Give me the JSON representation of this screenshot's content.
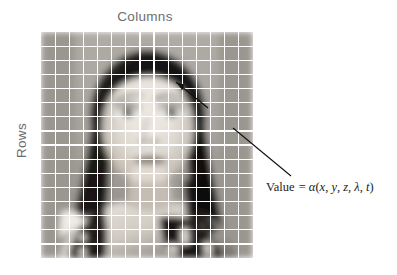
{
  "figure": {
    "background_color": "#ffffff",
    "width": 397,
    "height": 275
  },
  "axes": {
    "columns_label": "Columns",
    "rows_label": "Rows",
    "label_color": "#6e6e6e"
  },
  "image_grid": {
    "description": "grayscale portrait photograph overlaid with a white sampling grid",
    "columns": 15,
    "rows": 16,
    "grid_line_color": "#ffffff",
    "left": 41,
    "top": 32,
    "width": 212,
    "height": 226
  },
  "annotation": {
    "arrow_target": "pixel cell at the subject's right eye",
    "arrow_color": "#111111",
    "formula": {
      "lhs": "Value",
      "equals": "=",
      "function": "α",
      "open_paren": "(",
      "args": [
        "x",
        "y",
        "z",
        "λ",
        "t"
      ],
      "separator": ",",
      "close_paren": ")",
      "full_text": "Value = α(x, y, z, λ, t)"
    }
  },
  "chart_data": {
    "type": "heatmap",
    "title": "",
    "xlabel": "Columns",
    "ylabel": "Rows",
    "grid": true,
    "legend": null,
    "annotations": [
      "Value = α(x, y, z, λ, t)"
    ],
    "colormap": "grayscale",
    "shape": [
      16,
      15
    ],
    "values": [
      [
        118,
        112,
        108,
        168,
        178,
        180,
        181,
        182,
        184,
        184,
        183,
        181,
        178,
        172,
        160
      ],
      [
        120,
        114,
        110,
        166,
        176,
        179,
        180,
        182,
        184,
        184,
        182,
        180,
        176,
        170,
        158
      ],
      [
        122,
        116,
        112,
        158,
        150,
        140,
        138,
        150,
        162,
        168,
        170,
        172,
        172,
        168,
        156
      ],
      [
        124,
        118,
        114,
        120,
        54,
        32,
        36,
        58,
        40,
        34,
        48,
        120,
        160,
        166,
        154
      ],
      [
        126,
        120,
        116,
        70,
        34,
        190,
        210,
        46,
        28,
        205,
        215,
        52,
        130,
        162,
        150
      ],
      [
        128,
        122,
        118,
        40,
        36,
        200,
        205,
        44,
        30,
        210,
        200,
        46,
        60,
        150,
        146
      ],
      [
        130,
        124,
        120,
        44,
        48,
        150,
        158,
        60,
        52,
        160,
        150,
        50,
        44,
        120,
        142
      ],
      [
        132,
        126,
        122,
        52,
        160,
        198,
        205,
        200,
        175,
        195,
        185,
        48,
        40,
        80,
        138
      ],
      [
        134,
        128,
        124,
        60,
        185,
        210,
        215,
        150,
        120,
        200,
        190,
        44,
        38,
        60,
        134
      ],
      [
        136,
        130,
        126,
        80,
        195,
        215,
        218,
        205,
        200,
        205,
        150,
        42,
        36,
        52,
        130
      ],
      [
        138,
        132,
        128,
        210,
        200,
        120,
        90,
        100,
        170,
        190,
        60,
        38,
        34,
        48,
        126
      ],
      [
        140,
        134,
        60,
        40,
        50,
        45,
        55,
        60,
        70,
        50,
        36,
        32,
        30,
        44,
        122
      ],
      [
        142,
        136,
        44,
        30,
        35,
        40,
        45,
        50,
        40,
        34,
        30,
        28,
        190,
        40,
        118
      ],
      [
        144,
        138,
        38,
        28,
        200,
        38,
        42,
        46,
        36,
        32,
        205,
        185,
        36,
        36,
        114
      ],
      [
        146,
        140,
        34,
        195,
        34,
        34,
        38,
        42,
        32,
        200,
        30,
        28,
        32,
        32,
        110
      ],
      [
        148,
        142,
        30,
        26,
        30,
        30,
        34,
        38,
        28,
        26,
        26,
        24,
        28,
        28,
        106
      ]
    ]
  }
}
